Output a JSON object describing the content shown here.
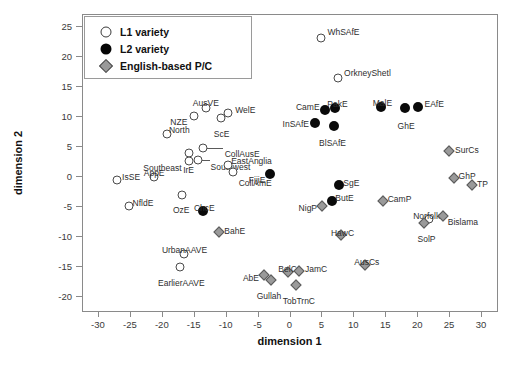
{
  "chart_data": {
    "type": "scatter",
    "title": "",
    "xlabel": "dimension 1",
    "ylabel": "dimension 2",
    "xlim": [
      -32.5,
      32.5
    ],
    "ylim": [
      -22.5,
      27.0
    ],
    "xticks": [
      -30,
      -25,
      -20,
      -15,
      -10,
      -5,
      0,
      5,
      10,
      15,
      20,
      25,
      30
    ],
    "yticks": [
      -20,
      -15,
      -10,
      -5,
      0,
      5,
      10,
      15,
      20,
      25
    ],
    "grid": false,
    "legend_position": "top-left",
    "series": [
      {
        "name": "L1 variety",
        "marker": "open-circle",
        "points": [
          {
            "label": "WhSAfE",
            "x": 5.0,
            "y": 23.0,
            "lx": 6,
            "ly": -11,
            "anchor": "start"
          },
          {
            "label": "OrkneyShetl",
            "x": 7.6,
            "y": 16.4,
            "lx": 6,
            "ly": -10,
            "anchor": "start"
          },
          {
            "label": "AusVE",
            "x": -13.1,
            "y": 11.3,
            "lx": 0,
            "ly": -10,
            "anchor": "middle"
          },
          {
            "label": "WelE",
            "x": -9.6,
            "y": 10.5,
            "lx": 7,
            "ly": -8,
            "anchor": "start"
          },
          {
            "label": "NZE",
            "x": -14.9,
            "y": 10.0,
            "lx": -7,
            "ly": 1,
            "anchor": "end"
          },
          {
            "label": "ScE",
            "x": -10.8,
            "y": 9.6,
            "lx": 1,
            "ly": 11,
            "anchor": "middle"
          },
          {
            "label": "North",
            "x": -19.2,
            "y": 7.0,
            "lx": 2,
            "ly": -9,
            "anchor": "start"
          },
          {
            "label": "CollAusE",
            "x": -13.6,
            "y": 4.6,
            "lx": 22,
            "ly": 1,
            "anchor": "start",
            "leader": 16
          },
          {
            "label": "IrE",
            "x": -15.8,
            "y": 3.8,
            "lx": 0,
            "ly": 12,
            "anchor": "middle"
          },
          {
            "label": "Southwest",
            "x": -14.4,
            "y": 2.6,
            "lx": 13,
            "ly": 2,
            "anchor": "start",
            "leader": 8
          },
          {
            "label": "Southeast",
            "x": -15.8,
            "y": 2.5,
            "lx": -7,
            "ly": 2,
            "anchor": "end"
          },
          {
            "label": "EastAngliaA",
            "x": -9.4,
            "y": 1.6,
            "lx": 3,
            "ly": -8,
            "anchor": "start",
            "hide": true
          },
          {
            "label": "EastAnglia",
            "x": -9.6,
            "y": 1.8,
            "lx": 3,
            "ly": -9,
            "anchor": "start"
          },
          {
            "label": "CollAmE",
            "x": -8.9,
            "y": 0.6,
            "lx": 6,
            "ly": 6,
            "anchor": "start"
          },
          {
            "label": "AppE",
            "x": -21.2,
            "y": -0.2,
            "lx": 0,
            "ly": -9,
            "anchor": "middle"
          },
          {
            "label": "IsSE",
            "x": -27.0,
            "y": -0.6,
            "lx": 5,
            "ly": -8,
            "anchor": "start"
          },
          {
            "label": "OzE",
            "x": -16.8,
            "y": -3.2,
            "lx": -1,
            "ly": 10,
            "anchor": "middle"
          },
          {
            "label": "NfldE",
            "x": -25.2,
            "y": -5.0,
            "lx": 4,
            "ly": -8,
            "anchor": "start"
          },
          {
            "label": "Norfolk",
            "x": 21.8,
            "y": -7.1,
            "lx": -2,
            "ly": -8,
            "anchor": "middle"
          },
          {
            "label": "UrbanAAVE",
            "x": -16.6,
            "y": -13.0,
            "lx": 1,
            "ly": -9,
            "anchor": "middle"
          },
          {
            "label": "EarlierAAVE",
            "x": -17.1,
            "y": -15.2,
            "lx": 1,
            "ly": 11,
            "anchor": "middle"
          }
        ]
      },
      {
        "name": "L2 variety",
        "marker": "filled-circle",
        "points": [
          {
            "label": "CamE",
            "x": 5.5,
            "y": 11.0,
            "lx": -5,
            "ly": -8,
            "anchor": "end"
          },
          {
            "label": "PakE",
            "x": 7.2,
            "y": 11.3,
            "lx": 2,
            "ly": -9,
            "anchor": "middle"
          },
          {
            "label": "MalE",
            "x": 14.4,
            "y": 11.5,
            "lx": 1,
            "ly": -9,
            "anchor": "middle"
          },
          {
            "label": "GhE",
            "x": 18.1,
            "y": 11.3,
            "lx": 1,
            "ly": 13,
            "anchor": "middle"
          },
          {
            "label": "EAfE",
            "x": 20.2,
            "y": 11.5,
            "lx": 6,
            "ly": -8,
            "anchor": "start"
          },
          {
            "label": "InSAfE",
            "x": 4.0,
            "y": 8.8,
            "lx": -6,
            "ly": -4,
            "anchor": "end"
          },
          {
            "label": "BlSAfE",
            "x": 6.9,
            "y": 8.3,
            "lx": -1,
            "ly": 12,
            "anchor": "middle"
          },
          {
            "label": "FijiE",
            "x": -3.0,
            "y": 0.4,
            "lx": -5,
            "ly": 1,
            "anchor": "end"
          },
          {
            "label": "SgE",
            "x": 7.8,
            "y": -1.5,
            "lx": 4,
            "ly": -7,
            "anchor": "start"
          },
          {
            "label": "ButE",
            "x": 6.7,
            "y": -4.2,
            "lx": 3,
            "ly": -8,
            "anchor": "start"
          },
          {
            "label": "ChcE",
            "x": -13.5,
            "y": -5.8,
            "lx": 1,
            "ly": -8,
            "anchor": "middle"
          }
        ]
      },
      {
        "name": "English-based P/C",
        "marker": "diamond",
        "points": [
          {
            "label": "SurCs",
            "x": 25.0,
            "y": 4.2,
            "lx": 6,
            "ly": -6,
            "anchor": "start"
          },
          {
            "label": "GhP",
            "x": 25.7,
            "y": -0.4,
            "lx": 5,
            "ly": -7,
            "anchor": "start"
          },
          {
            "label": "TP",
            "x": 28.6,
            "y": -1.5,
            "lx": 5,
            "ly": -6,
            "anchor": "start"
          },
          {
            "label": "CamP",
            "x": 14.6,
            "y": -4.2,
            "lx": 5,
            "ly": -7,
            "anchor": "start"
          },
          {
            "label": "NigP",
            "x": 5.1,
            "y": -5.0,
            "lx": -5,
            "ly": -3,
            "anchor": "end"
          },
          {
            "label": "Bislama",
            "x": 24.0,
            "y": -6.6,
            "lx": 5,
            "ly": 1,
            "anchor": "start"
          },
          {
            "label": "SolP",
            "x": 21.0,
            "y": -7.9,
            "lx": 3,
            "ly": 11,
            "anchor": "middle"
          },
          {
            "label": "HawC",
            "x": 8.0,
            "y": -9.8,
            "lx": 2,
            "ly": -7,
            "anchor": "middle"
          },
          {
            "label": "BahE",
            "x": -11.0,
            "y": -9.3,
            "lx": 5,
            "ly": -6,
            "anchor": "start"
          },
          {
            "label": "AusCs",
            "x": 11.8,
            "y": -14.8,
            "lx": 2,
            "ly": -8,
            "anchor": "middle"
          },
          {
            "label": "BelC",
            "x": -0.3,
            "y": -16.0,
            "lx": 0,
            "ly": -8,
            "anchor": "middle"
          },
          {
            "label": "JamC",
            "x": 1.5,
            "y": -15.9,
            "lx": 6,
            "ly": -7,
            "anchor": "start"
          },
          {
            "label": "AbE",
            "x": -4.0,
            "y": -16.5,
            "lx": -5,
            "ly": -2,
            "anchor": "end"
          },
          {
            "label": "Gullah",
            "x": -2.9,
            "y": -17.3,
            "lx": -2,
            "ly": 11,
            "anchor": "middle"
          },
          {
            "label": "TobTrnC",
            "x": 1.0,
            "y": -18.1,
            "lx": 3,
            "ly": 11,
            "anchor": "middle"
          }
        ]
      }
    ]
  },
  "legend": {
    "entries": [
      {
        "label": "L1 variety",
        "marker": "open-circle"
      },
      {
        "label": "L2 variety",
        "marker": "filled-circle"
      },
      {
        "label": "English-based P/C",
        "marker": "diamond"
      }
    ]
  },
  "colors": {
    "axis": "#8a8a8a",
    "open_marker_stroke": "#4a4a4a",
    "filled_marker": "#0a0a0a",
    "diamond_fill": "#9a9a9a",
    "diamond_stroke": "#5a5a5a",
    "label_text": "#2e2e2e"
  }
}
